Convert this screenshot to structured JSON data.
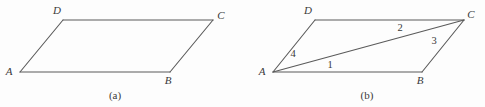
{
  "figure": {
    "background_color": "#fdfdfd",
    "stroke_color": "#5a5a5a",
    "text_color": "#3a3a3a",
    "panels": [
      {
        "caption": "(a)",
        "caption_x": 115,
        "caption_y": 99,
        "shape": "parallelogram",
        "vertices": [
          {
            "name": "A",
            "label": "A",
            "x": 20,
            "y": 72,
            "label_x": 9,
            "label_y": 75
          },
          {
            "name": "B",
            "label": "B",
            "x": 170,
            "y": 72,
            "label_x": 168,
            "label_y": 84
          },
          {
            "name": "C",
            "label": "C",
            "x": 213,
            "y": 20,
            "label_x": 221,
            "label_y": 19
          },
          {
            "name": "D",
            "label": "D",
            "x": 63,
            "y": 20,
            "label_x": 57,
            "label_y": 14
          }
        ],
        "edges": [
          {
            "name": "side-AB",
            "from": "A",
            "to": "B"
          },
          {
            "name": "side-BC",
            "from": "B",
            "to": "C"
          },
          {
            "name": "side-CD",
            "from": "C",
            "to": "D"
          },
          {
            "name": "side-DA",
            "from": "D",
            "to": "A"
          }
        ],
        "diagonals": [],
        "angle_labels": []
      },
      {
        "caption": "(b)",
        "caption_x": 367,
        "caption_y": 99,
        "shape": "parallelogram-with-diagonal",
        "vertices": [
          {
            "name": "A",
            "label": "A",
            "x": 273,
            "y": 72,
            "label_x": 262,
            "label_y": 75
          },
          {
            "name": "B",
            "label": "B",
            "x": 422,
            "y": 72,
            "label_x": 420,
            "label_y": 84
          },
          {
            "name": "C",
            "label": "C",
            "x": 464,
            "y": 20,
            "label_x": 471,
            "label_y": 18
          },
          {
            "name": "D",
            "label": "D",
            "x": 315,
            "y": 20,
            "label_x": 308,
            "label_y": 14
          }
        ],
        "edges": [
          {
            "name": "side-AB",
            "from": "A",
            "to": "B"
          },
          {
            "name": "side-BC",
            "from": "B",
            "to": "C"
          },
          {
            "name": "side-CD",
            "from": "C",
            "to": "D"
          },
          {
            "name": "side-DA",
            "from": "D",
            "to": "A"
          }
        ],
        "diagonals": [
          {
            "name": "diagonal-AC",
            "from": "A",
            "to": "C"
          }
        ],
        "angle_labels": [
          {
            "name": "angle-1",
            "label": "1",
            "x": 330,
            "y": 68,
            "at_vertex": "A"
          },
          {
            "name": "angle-2",
            "label": "2",
            "x": 400,
            "y": 31,
            "at_vertex": "C"
          },
          {
            "name": "angle-3",
            "label": "3",
            "x": 434,
            "y": 44,
            "at_vertex": "C"
          },
          {
            "name": "angle-4",
            "label": "4",
            "x": 293,
            "y": 57,
            "at_vertex": "A"
          }
        ]
      }
    ]
  }
}
